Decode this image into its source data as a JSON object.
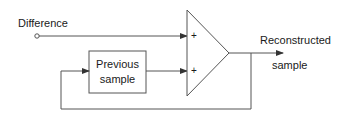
{
  "diagram": {
    "type": "block-diagram",
    "title": "",
    "input_label": "Difference",
    "output_label_line1": "Reconstructed",
    "output_label_line2": "sample",
    "block": {
      "label_line1": "Previous",
      "label_line2": "sample"
    },
    "adder": {
      "shape": "triangle",
      "input_signs": [
        "+",
        "+"
      ]
    },
    "edges": [
      {
        "from": "Difference",
        "to": "adder input 1"
      },
      {
        "from": "Previous sample",
        "to": "adder input 2"
      },
      {
        "from": "adder output",
        "to": "Reconstructed sample"
      },
      {
        "from": "Reconstructed sample",
        "to": "Previous sample",
        "kind": "feedback"
      }
    ],
    "colors": {
      "line": "#555555",
      "text": "#1a1a1a",
      "background": "#ffffff"
    }
  }
}
